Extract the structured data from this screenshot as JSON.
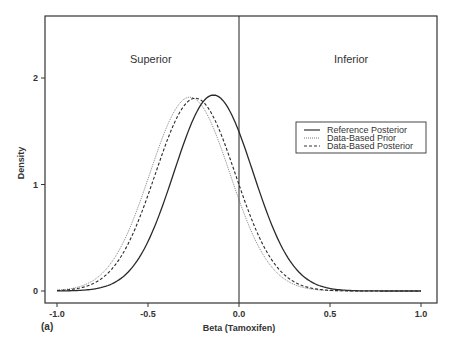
{
  "chart_data": {
    "type": "line",
    "title": "",
    "panel_label": "(a)",
    "xlabel": "Beta (Tamoxifen)",
    "ylabel": "Density",
    "xlim": [
      -1.0,
      1.0
    ],
    "ylim": [
      0,
      2.5
    ],
    "x_ticks": [
      -1.0,
      -0.5,
      0.0,
      0.5,
      1.0
    ],
    "x_tick_labels": [
      "-1.0",
      "-0.5",
      "0.0",
      "0.5",
      "1.0"
    ],
    "y_ticks": [
      0,
      1,
      2
    ],
    "y_tick_labels": [
      "0",
      "1",
      "2"
    ],
    "grid": false,
    "reference_line_x": 0.0,
    "annotations": [
      {
        "text": "Superior",
        "x": -0.5,
        "y": 2.0
      },
      {
        "text": "Inferior",
        "x": 0.58,
        "y": 2.0
      }
    ],
    "legend": {
      "position": "right-middle",
      "entries": [
        {
          "label": "Reference Posterior",
          "style": "solid"
        },
        {
          "label": "Data-Based Prior",
          "style": "dotted"
        },
        {
          "label": "Data-Based Posterior",
          "style": "dashed"
        }
      ]
    },
    "series": [
      {
        "name": "Reference Posterior",
        "style": "solid",
        "distribution": "normal",
        "mean": -0.14,
        "sd": 0.217,
        "peak": 1.84,
        "x": [
          -1.0,
          -0.8,
          -0.6,
          -0.5,
          -0.4,
          -0.3,
          -0.2,
          -0.14,
          -0.1,
          0.0,
          0.1,
          0.2,
          0.3,
          0.4,
          0.5,
          0.6,
          0.8,
          1.0
        ],
        "y": [
          0.0,
          0.02,
          0.2,
          0.47,
          0.9,
          1.4,
          1.76,
          1.84,
          1.81,
          1.5,
          1.0,
          0.47,
          0.18,
          0.05,
          0.01,
          0.0,
          0.0,
          0.0
        ]
      },
      {
        "name": "Data-Based Prior",
        "style": "dotted",
        "distribution": "normal",
        "mean": -0.27,
        "sd": 0.22,
        "peak": 1.82,
        "x": [
          -1.0,
          -0.8,
          -0.6,
          -0.5,
          -0.4,
          -0.27,
          -0.2,
          -0.1,
          0.0,
          0.1,
          0.2,
          0.3,
          0.4,
          0.5,
          0.6,
          0.8,
          1.0
        ],
        "y": [
          0.04,
          0.17,
          0.6,
          1.05,
          1.52,
          1.82,
          1.74,
          1.35,
          0.85,
          0.44,
          0.18,
          0.06,
          0.02,
          0.0,
          0.0,
          0.0,
          0.0
        ]
      },
      {
        "name": "Data-Based Posterior",
        "style": "dashed",
        "distribution": "normal",
        "mean": -0.24,
        "sd": 0.22,
        "peak": 1.81,
        "x": [
          -1.0,
          -0.8,
          -0.6,
          -0.5,
          -0.4,
          -0.24,
          -0.2,
          -0.1,
          0.0,
          0.1,
          0.2,
          0.3,
          0.4,
          0.5,
          0.6,
          0.8,
          1.0
        ],
        "y": [
          0.02,
          0.1,
          0.48,
          0.9,
          1.4,
          1.81,
          1.78,
          1.48,
          1.0,
          0.55,
          0.24,
          0.08,
          0.02,
          0.0,
          0.0,
          0.0,
          0.0
        ]
      }
    ]
  }
}
